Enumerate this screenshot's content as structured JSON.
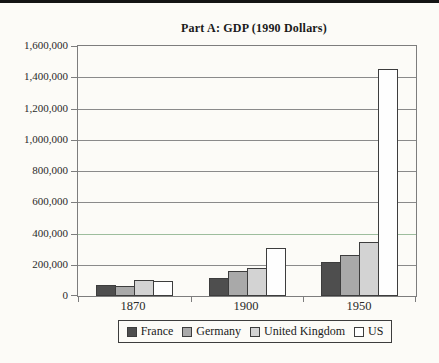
{
  "page": {
    "background": "#fcfbf7",
    "top_rule_color": "#141414"
  },
  "chart_data": {
    "type": "bar",
    "title": "Part A: GDP (1990 Dollars)",
    "categories": [
      "1870",
      "1900",
      "1950"
    ],
    "series": [
      {
        "name": "France",
        "color": "#4e4e4e",
        "values": [
          73000,
          115000,
          220000
        ]
      },
      {
        "name": "Germany",
        "color": "#a9a9a9",
        "values": [
          64000,
          163000,
          265000
        ]
      },
      {
        "name": "United Kingdom",
        "color": "#d3d3d3",
        "values": [
          100000,
          180000,
          348000
        ]
      },
      {
        "name": "US",
        "color": "#fefefe",
        "values": [
          98000,
          305000,
          1450000
        ]
      }
    ],
    "xlabel": "",
    "ylabel": "",
    "ylim": [
      0,
      1600000
    ],
    "y_tick_step": 200000,
    "y_tick_labels": [
      "0",
      "200,000",
      "400,000",
      "600,000",
      "800,000",
      "1,000,000",
      "1,200,000",
      "1,400,000",
      "1,600,000"
    ],
    "grid": true,
    "legend_position": "bottom"
  },
  "style": {
    "bar_border_color": "#3d3d3d",
    "frame_color": "#7d7d7d",
    "grid_color": "#8a8a8a",
    "grid_highlight_value": 400000,
    "grid_highlight_color": "#9dbd9d",
    "text_color": "#2a2a2a"
  }
}
